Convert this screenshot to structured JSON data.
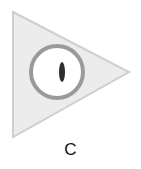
{
  "figure": {
    "label": "C",
    "colors": {
      "triangle_fill": "#ececec",
      "triangle_stroke": "#cfcfcf",
      "ring_stroke": "#9a9a9a",
      "ring_fill": "#ffffff",
      "pupil": "#2e2e2e"
    }
  }
}
